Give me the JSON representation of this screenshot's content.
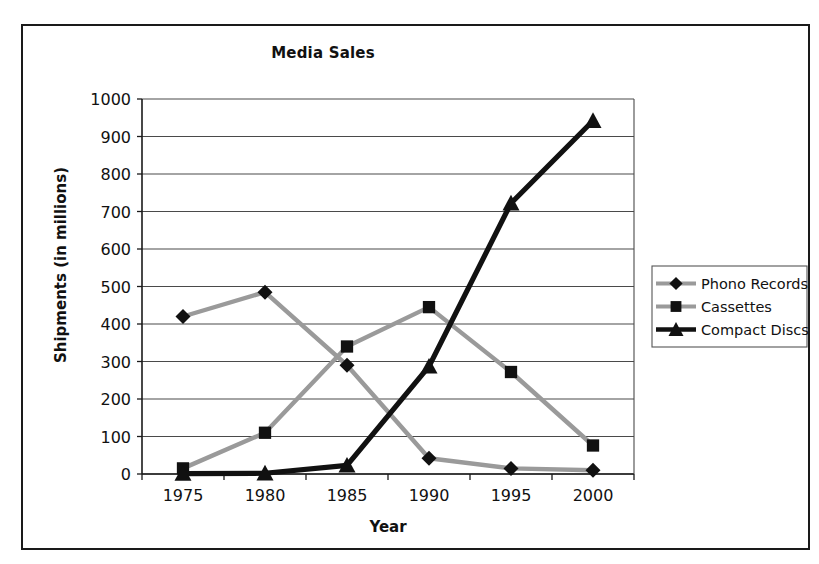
{
  "chart_data": {
    "type": "line",
    "title": "Media Sales",
    "xlabel": "Year",
    "ylabel": "Shipments (in millions)",
    "categories": [
      "1975",
      "1980",
      "1985",
      "1990",
      "1995",
      "2000"
    ],
    "ylim": [
      0,
      1000
    ],
    "y_ticks": [
      "0",
      "100",
      "200",
      "300",
      "400",
      "500",
      "600",
      "700",
      "800",
      "900",
      "1000"
    ],
    "grid": true,
    "legend_position": "right",
    "series": [
      {
        "name": "Phono Records",
        "marker": "diamond",
        "color": "#9a9a9a",
        "marker_color": "#111111",
        "values": [
          420,
          485,
          290,
          42,
          15,
          10
        ]
      },
      {
        "name": "Cassettes",
        "marker": "square",
        "color": "#9a9a9a",
        "marker_color": "#111111",
        "values": [
          15,
          110,
          340,
          445,
          272,
          76
        ]
      },
      {
        "name": "Compact Discs",
        "marker": "triangle",
        "color": "#111111",
        "marker_color": "#111111",
        "values": [
          1,
          2,
          23,
          287,
          722,
          942
        ]
      }
    ]
  }
}
